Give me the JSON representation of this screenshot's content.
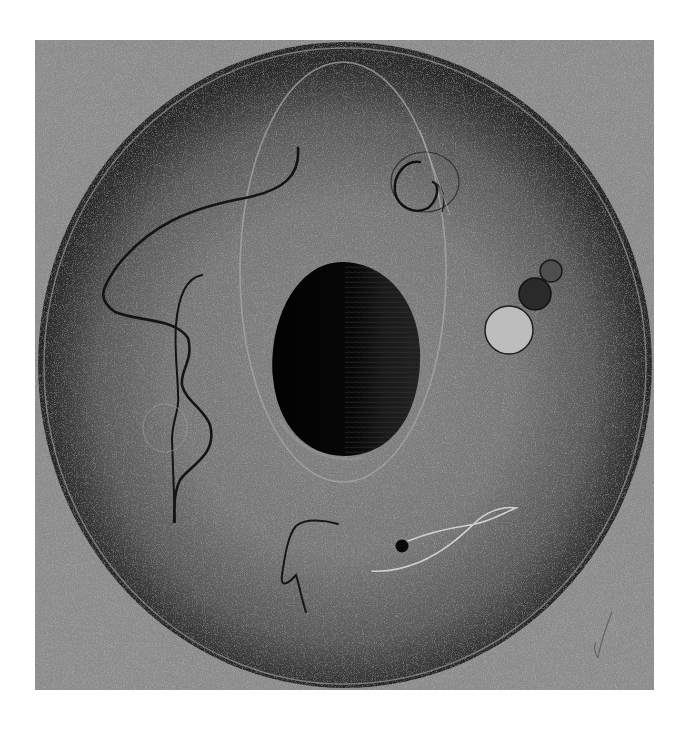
{
  "artwork": {
    "title": "Abstract circular composition",
    "description": "Grayscale noisy panel with a large dark-rimmed disc, central black egg shape inside a faint oval ring, scribbled black lines, three stacked circles on the right, a small black dot with a white wisp, and a faint pencil mark in the lower right corner",
    "colors": {
      "page_background": "#ffffff",
      "panel": "#8e8e8e",
      "disc_center": "#7c7c7c",
      "disc_rim": "#2e2e2e",
      "rim_highlight": "#b0b0b0",
      "egg": "#050505",
      "egg_right": "#1c1c1c",
      "oval_ring": "#a4a4a4",
      "line_dark": "#151515",
      "circle_small": "#4e4e4e",
      "circle_mid": "#2a2a2a",
      "circle_large": "#bdbdbd",
      "dot": "#0a0a0a",
      "wisp": "#d8d8d8",
      "pencil_mark": "#555555"
    }
  }
}
